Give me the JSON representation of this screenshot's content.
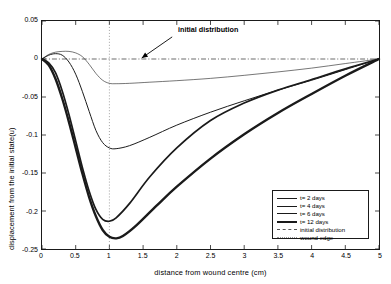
{
  "chart_data": {
    "type": "line",
    "title": "",
    "xlabel": "distance from wound centre  (cm)",
    "ylabel": "displacement from the initial state(u)",
    "xlim": [
      0,
      5
    ],
    "ylim": [
      -0.25,
      0.05
    ],
    "xticks": [
      "0",
      "0.5",
      "1",
      "1.5",
      "2",
      "2.5",
      "3",
      "3.5",
      "4",
      "4.5",
      "5"
    ],
    "xtick_values": [
      0,
      0.5,
      1,
      1.5,
      2,
      2.5,
      3,
      3.5,
      4,
      4.5,
      5
    ],
    "yticks": [
      "0.05",
      "0",
      "-0.05",
      "-0.1",
      "-0.15",
      "-0.2",
      "-0.25"
    ],
    "ytick_values": [
      0.05,
      0,
      -0.05,
      -0.1,
      -0.15,
      -0.2,
      -0.25
    ],
    "grid": false,
    "legend_position": "lower right",
    "annotations": [
      {
        "text": "initial distribution",
        "x": 2.02,
        "y": 0.033,
        "arrow_to_x": 1.48,
        "arrow_to_y": 0.0
      }
    ],
    "reference_lines": [
      {
        "name": "initial distribution",
        "orientation": "horizontal",
        "value": 0.0,
        "style": "dashdot"
      },
      {
        "name": "wound edge",
        "orientation": "vertical",
        "value": 1.0,
        "style": "dotted"
      }
    ],
    "series": [
      {
        "name": "t= 2 days",
        "linewidth": 0.6,
        "color": "#1a1a1a",
        "minimum": {
          "x": 1.05,
          "y": -0.032
        },
        "x": [
          0,
          0.1,
          0.2,
          0.3,
          0.4,
          0.5,
          0.6,
          0.7,
          0.8,
          0.9,
          1.0,
          1.1,
          1.3,
          1.6,
          2.0,
          2.5,
          3.0,
          3.5,
          4.0,
          4.5,
          5.0
        ],
        "y": [
          0,
          0.006,
          0.009,
          0.01,
          0.01,
          0.008,
          0.003,
          -0.007,
          -0.019,
          -0.028,
          -0.032,
          -0.0325,
          -0.032,
          -0.0305,
          -0.0285,
          -0.0255,
          -0.0215,
          -0.017,
          -0.012,
          -0.006,
          0
        ]
      },
      {
        "name": "t= 4 days",
        "linewidth": 1.0,
        "color": "#1a1a1a",
        "minimum": {
          "x": 1.0,
          "y": -0.118
        },
        "x": [
          0,
          0.1,
          0.2,
          0.3,
          0.4,
          0.5,
          0.6,
          0.7,
          0.8,
          0.9,
          1.0,
          1.1,
          1.3,
          1.6,
          2.0,
          2.5,
          3.0,
          3.5,
          4.0,
          4.5,
          5.0
        ],
        "y": [
          0,
          0.005,
          0.007,
          0.005,
          -0.004,
          -0.02,
          -0.043,
          -0.069,
          -0.094,
          -0.11,
          -0.117,
          -0.118,
          -0.114,
          -0.103,
          -0.087,
          -0.07,
          -0.055,
          -0.041,
          -0.028,
          -0.014,
          0
        ]
      },
      {
        "name": "t= 6 days",
        "linewidth": 1.7,
        "color": "#1a1a1a",
        "minimum": {
          "x": 0.95,
          "y": -0.214
        },
        "x": [
          0,
          0.1,
          0.2,
          0.3,
          0.4,
          0.5,
          0.6,
          0.7,
          0.8,
          0.9,
          1.0,
          1.1,
          1.3,
          1.6,
          2.0,
          2.5,
          3.0,
          3.5,
          4.0,
          4.5,
          5.0
        ],
        "y": [
          0,
          -0.005,
          -0.018,
          -0.042,
          -0.073,
          -0.108,
          -0.143,
          -0.174,
          -0.198,
          -0.211,
          -0.2135,
          -0.209,
          -0.19,
          -0.155,
          -0.117,
          -0.081,
          -0.058,
          -0.041,
          -0.027,
          -0.013,
          0
        ]
      },
      {
        "name": "t= 12 days",
        "linewidth": 2.4,
        "color": "#1a1a1a",
        "minimum": {
          "x": 1.08,
          "y": -0.236
        },
        "x": [
          0,
          0.1,
          0.2,
          0.3,
          0.4,
          0.5,
          0.6,
          0.7,
          0.8,
          0.9,
          1.0,
          1.1,
          1.2,
          1.4,
          1.7,
          2.0,
          2.5,
          3.0,
          3.5,
          4.0,
          4.5,
          5.0
        ],
        "y": [
          0,
          -0.008,
          -0.026,
          -0.052,
          -0.083,
          -0.117,
          -0.151,
          -0.182,
          -0.207,
          -0.225,
          -0.234,
          -0.236,
          -0.233,
          -0.219,
          -0.193,
          -0.168,
          -0.131,
          -0.099,
          -0.071,
          -0.046,
          -0.022,
          0
        ]
      }
    ]
  },
  "legend": {
    "entries": [
      {
        "label": "t= 2 days",
        "style": "solid-thin"
      },
      {
        "label": "t= 4 days",
        "style": "solid-medium"
      },
      {
        "label": "t= 6 days",
        "style": "solid-thick"
      },
      {
        "label": "t= 12 days",
        "style": "solid-thickest"
      },
      {
        "label": "initial distribution",
        "style": "dashdot"
      },
      {
        "label": "wound edge",
        "style": "dotted"
      }
    ]
  },
  "axes": {
    "xlabel": "distance from wound centre  (cm)",
    "ylabel": "displacement from the initial state(u)"
  },
  "annotation": {
    "text": "initial distribution"
  },
  "colors": {
    "axis": "#1a1a1a",
    "curve": "#1a1a1a",
    "background": "#ffffff"
  }
}
